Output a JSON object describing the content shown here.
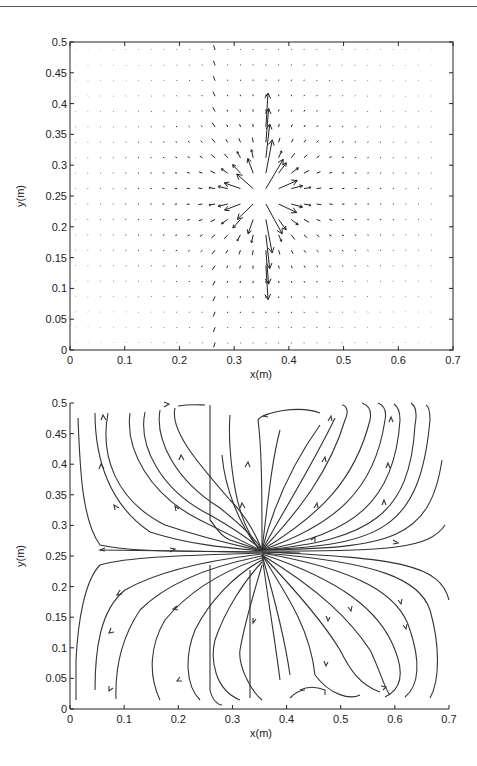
{
  "chart_data": [
    {
      "type": "quiver",
      "title": "",
      "xlabel": "x(m)",
      "ylabel": "y(m)",
      "xlim": [
        0,
        0.7
      ],
      "ylim": [
        0,
        0.5
      ],
      "xticks": [
        "0",
        "0.1",
        "0.2",
        "0.3",
        "0.4",
        "0.5",
        "0.6",
        "0.7"
      ],
      "yticks": [
        "0",
        "0.05",
        "0.1",
        "0.15",
        "0.2",
        "0.25",
        "0.3",
        "0.35",
        "0.4",
        "0.45",
        "0.5"
      ],
      "grid": false,
      "box": true,
      "source": {
        "x": 0.35,
        "y": 0.25,
        "description": "radial outward flow from point near (0.35, 0.25); strongest vertical arrows up and down"
      },
      "discontinuity_x": 0.26,
      "grid_spacing": {
        "dx": 0.023,
        "dy": 0.025
      }
    },
    {
      "type": "streamline",
      "title": "",
      "xlabel": "x(m)",
      "ylabel": "y(m)",
      "xlim": [
        0,
        0.7
      ],
      "ylim": [
        0,
        0.5
      ],
      "xticks": [
        "0",
        "0.1",
        "0.2",
        "0.3",
        "0.4",
        "0.5",
        "0.6",
        "0.7"
      ],
      "yticks": [
        "0",
        "0.05",
        "0.1",
        "0.15",
        "0.2",
        "0.25",
        "0.3",
        "0.35",
        "0.4",
        "0.45",
        "0.5"
      ],
      "grid": false,
      "box": false,
      "source": {
        "x": 0.35,
        "y": 0.25
      },
      "description": "streamlines emanating from source at (0.35,0.25), fanning upward to y=0.5 and downward to y=0, with arrows indicating outward flow"
    }
  ],
  "labels": {
    "top": {
      "xlabel": "x(m)",
      "ylabel": "y(m)"
    },
    "bottom": {
      "xlabel": "x(m)",
      "ylabel": "y(m)"
    }
  }
}
